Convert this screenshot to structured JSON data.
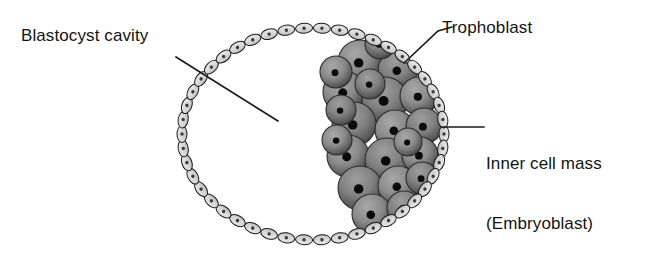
{
  "figure": {
    "subject": "blastocyst",
    "background_color": "#ffffff",
    "width": 657,
    "height": 262
  },
  "labels": {
    "blastocyst_cavity": "Blastocyst cavity",
    "trophoblast": "Trophoblast",
    "inner_cell_mass_line1": "Inner cell mass",
    "inner_cell_mass_line2": "(Embryoblast)"
  },
  "icons": {
    "leader_line_cavity": "leader-line-icon",
    "leader_line_trophoblast": "leader-line-icon",
    "leader_line_icm": "leader-line-icon"
  },
  "colors": {
    "outline": "#1a1a1a",
    "trophoblast_fill": "#dcdcdc",
    "trophoblast_fill_shadow": "#b9b9b9",
    "trophoblast_nucleus": "#3a3a3a",
    "icm_fill_light": "#9d9d9d",
    "icm_fill_mid": "#7e7e7e",
    "icm_fill_dark": "#4a4a4a",
    "icm_nucleus": "#0a0a0a",
    "label_text": "#141414",
    "background": "#ffffff"
  },
  "geometry": {
    "blastocyst_center_x": 313,
    "blastocyst_center_y": 134,
    "blastocyst_radius_x": 131,
    "blastocyst_radius_y": 106,
    "trophoblast_cell_count": 46,
    "trophoblast_cell_length": 17,
    "trophoblast_cell_width": 10,
    "inner_cell_mass_cell_count": 22
  },
  "leaders": {
    "cavity": {
      "x1": 176,
      "y1": 57,
      "x2": 278,
      "y2": 121
    },
    "trophoblast": {
      "x1": 404,
      "y1": 63,
      "x2": 438,
      "y2": 31,
      "x3": 452,
      "y3": 27
    },
    "icm": {
      "x1": 442,
      "y1": 127,
      "x2": 484,
      "y2": 127
    }
  },
  "trophoblast_cells": [
    {
      "angle": 0
    },
    {
      "angle": 7.826
    },
    {
      "angle": 15.652
    },
    {
      "angle": 23.478
    },
    {
      "angle": 31.304
    },
    {
      "angle": 39.13
    },
    {
      "angle": 46.957
    },
    {
      "angle": 54.783
    },
    {
      "angle": 62.609
    },
    {
      "angle": 70.435
    },
    {
      "angle": 78.261
    },
    {
      "angle": 86.087
    },
    {
      "angle": 93.913
    },
    {
      "angle": 101.739
    },
    {
      "angle": 109.565
    },
    {
      "angle": 117.391
    },
    {
      "angle": 125.217
    },
    {
      "angle": 133.043
    },
    {
      "angle": 140.87
    },
    {
      "angle": 148.696
    },
    {
      "angle": 156.522
    },
    {
      "angle": 164.348
    },
    {
      "angle": 172.174
    },
    {
      "angle": 180
    },
    {
      "angle": 187.826
    },
    {
      "angle": 195.652
    },
    {
      "angle": 203.478
    },
    {
      "angle": 211.304
    },
    {
      "angle": 219.13
    },
    {
      "angle": 226.957
    },
    {
      "angle": 234.783
    },
    {
      "angle": 242.609
    },
    {
      "angle": 250.435
    },
    {
      "angle": 258.261
    },
    {
      "angle": 266.087
    },
    {
      "angle": 273.913
    },
    {
      "angle": 281.739
    },
    {
      "angle": 289.565
    },
    {
      "angle": 297.391
    },
    {
      "angle": 305.217
    },
    {
      "angle": 313.043
    },
    {
      "angle": 320.87
    },
    {
      "angle": 328.696
    },
    {
      "angle": 336.522
    },
    {
      "angle": 344.348
    },
    {
      "angle": 352.174
    }
  ],
  "inner_cell_mass_cells": [
    {
      "cx": 360,
      "cy": 62,
      "r": 22
    },
    {
      "cx": 398,
      "cy": 70,
      "r": 20
    },
    {
      "cx": 344,
      "cy": 92,
      "r": 21
    },
    {
      "cx": 385,
      "cy": 100,
      "r": 23
    },
    {
      "cx": 419,
      "cy": 96,
      "r": 19
    },
    {
      "cx": 354,
      "cy": 124,
      "r": 22
    },
    {
      "cx": 395,
      "cy": 130,
      "r": 20
    },
    {
      "cx": 424,
      "cy": 126,
      "r": 18
    },
    {
      "cx": 348,
      "cy": 156,
      "r": 21
    },
    {
      "cx": 387,
      "cy": 160,
      "r": 22
    },
    {
      "cx": 420,
      "cy": 155,
      "r": 18
    },
    {
      "cx": 360,
      "cy": 188,
      "r": 22
    },
    {
      "cx": 398,
      "cy": 186,
      "r": 20
    },
    {
      "cx": 422,
      "cy": 178,
      "r": 16
    },
    {
      "cx": 372,
      "cy": 214,
      "r": 20
    },
    {
      "cx": 404,
      "cy": 208,
      "r": 17
    },
    {
      "cx": 336,
      "cy": 72,
      "r": 16
    },
    {
      "cx": 341,
      "cy": 110,
      "r": 15
    },
    {
      "cx": 337,
      "cy": 140,
      "r": 15
    },
    {
      "cx": 370,
      "cy": 84,
      "r": 15
    },
    {
      "cx": 408,
      "cy": 142,
      "r": 14
    },
    {
      "cx": 380,
      "cy": 44,
      "r": 15
    }
  ]
}
